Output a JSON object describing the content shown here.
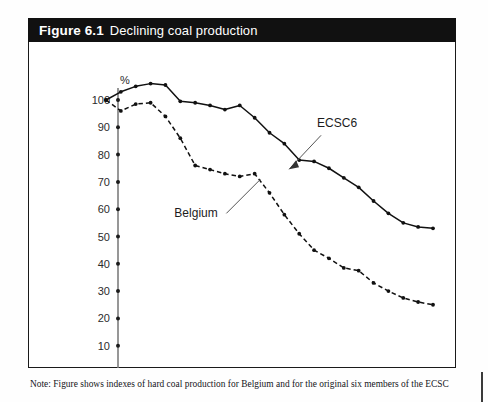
{
  "figure": {
    "number": "Figure 6.1",
    "title": "Declining coal production"
  },
  "note": {
    "line1": "Note: Figure shows indexes of hard coal production for Belgium and for the original six members of the ECSC",
    "line2": ""
  },
  "chart_data": {
    "type": "line",
    "title": "Declining coal production",
    "xlabel": "",
    "ylabel": "%",
    "ylim": [
      0,
      100
    ],
    "yticks": [
      0,
      10,
      20,
      30,
      40,
      50,
      60,
      70,
      80,
      90,
      100
    ],
    "xlim": [
      1954,
      1976
    ],
    "xticks": [
      1955,
      1957,
      1959,
      1961,
      1963,
      1965,
      1967,
      1969,
      1971,
      1973,
      1975
    ],
    "xtick_labels": [
      "1955",
      "1957",
      "1959",
      "1961",
      "1963",
      "1965",
      "1967",
      "1969",
      "1971",
      "1973",
      "1975"
    ],
    "grid": false,
    "legend_position": "inline-annotations",
    "x": [
      1954,
      1955,
      1956,
      1957,
      1958,
      1959,
      1960,
      1961,
      1962,
      1963,
      1964,
      1965,
      1966,
      1967,
      1968,
      1969,
      1970,
      1971,
      1972,
      1973,
      1974,
      1975,
      1976
    ],
    "series": [
      {
        "name": "ECSC6",
        "style": "solid",
        "values": [
          100,
          103,
          105,
          106,
          105.5,
          99.5,
          99,
          98,
          96.5,
          98,
          93.5,
          88,
          84,
          78,
          77.5,
          75,
          71.5,
          68,
          63,
          58.5,
          55,
          53.5,
          53
        ]
      },
      {
        "name": "Belgium",
        "style": "dashed",
        "values": [
          100,
          96,
          98.5,
          99,
          94,
          86,
          76,
          74.5,
          73,
          72,
          73,
          66,
          58,
          51,
          45,
          42,
          38.5,
          37.5,
          33,
          30,
          27.5,
          26,
          25
        ]
      }
    ],
    "annotations": [
      {
        "text": "ECSC6",
        "x": 1968.2,
        "y": 90
      },
      {
        "text": "Belgium",
        "x": 1958.6,
        "y": 57
      }
    ]
  }
}
